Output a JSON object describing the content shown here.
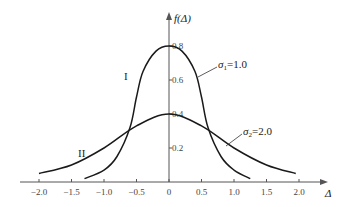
{
  "chart_data": {
    "type": "line",
    "title": "",
    "xlabel": "Δ",
    "ylabel": "f(Δ)",
    "xlim": [
      -2.0,
      2.0
    ],
    "ylim": [
      0,
      0.8
    ],
    "x_ticks": [
      "-2.0",
      "-1.5",
      "-1.0",
      "-0.5",
      "0",
      "0.5",
      "1.0",
      "1.5",
      "2.0"
    ],
    "y_ticks": [
      "0.2",
      "0.4",
      "0.6",
      "0.8"
    ],
    "grid": false,
    "series": [
      {
        "name": "I",
        "annotation": "σ1=1.0",
        "peak": 0.8,
        "x": [
          -1.3,
          -1.0,
          -0.8,
          -0.6,
          -0.5,
          -0.4,
          -0.2,
          0,
          0.2,
          0.4,
          0.5,
          0.6,
          0.8,
          1.0,
          1.25
        ],
        "values": [
          0.02,
          0.07,
          0.15,
          0.32,
          0.5,
          0.65,
          0.77,
          0.8,
          0.77,
          0.65,
          0.5,
          0.32,
          0.15,
          0.07,
          0.02
        ]
      },
      {
        "name": "II",
        "annotation": "σ2=2.0",
        "peak": 0.4,
        "x": [
          -2.0,
          -1.5,
          -1.0,
          -0.5,
          0,
          0.5,
          1.0,
          1.5,
          1.95
        ],
        "values": [
          0.05,
          0.1,
          0.2,
          0.33,
          0.4,
          0.33,
          0.2,
          0.1,
          0.05
        ]
      }
    ]
  },
  "labels": {
    "y_axis": "f(Δ)",
    "x_axis": "Δ",
    "curve_1": "I",
    "curve_2": "II",
    "sigma_1": "σ",
    "sigma_1_sub": "1",
    "sigma_1_val": "=1.0",
    "sigma_2": "σ",
    "sigma_2_sub": "2",
    "sigma_2_val": "=2.0"
  }
}
